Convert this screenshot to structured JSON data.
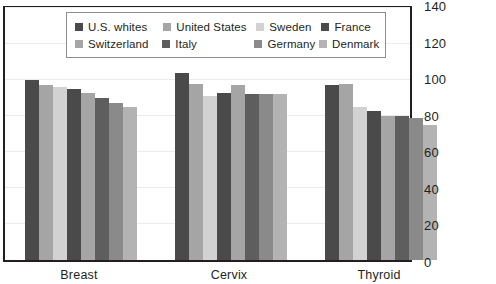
{
  "chart_data": {
    "type": "bar",
    "title": "",
    "subtitle": "",
    "xlabel": "",
    "ylabel": "",
    "categories": [
      "Breast",
      "Cervix",
      "Thyroid"
    ],
    "ylim": [
      0,
      140
    ],
    "yticks": [
      0,
      20,
      40,
      60,
      80,
      100,
      120,
      140
    ],
    "ytick_labels": [
      "0",
      "20",
      "40",
      "60",
      "80",
      "100",
      "120",
      "140"
    ],
    "grid": true,
    "legend_position": "top-center",
    "series": [
      {
        "name": "U.S. whites",
        "color": "#4a4a4a",
        "values": [
          100,
          104,
          97
        ]
      },
      {
        "name": "United States",
        "color": "#a5a5a5",
        "values": [
          97,
          98,
          98
        ]
      },
      {
        "name": "Sweden",
        "color": "#d2d2d2",
        "values": [
          96,
          91,
          85
        ]
      },
      {
        "name": "France",
        "color": "#4a4a4a",
        "values": [
          95,
          93,
          83
        ]
      },
      {
        "name": "Switzerland",
        "color": "#a5a5a5",
        "values": [
          93,
          97,
          80
        ]
      },
      {
        "name": "Italy",
        "color": "#5e5e5e",
        "values": [
          90,
          92,
          80
        ]
      },
      {
        "name": "Germany",
        "color": "#8a8a8a",
        "values": [
          87,
          92,
          79
        ]
      },
      {
        "name": "Denmark",
        "color": "#b3b3b3",
        "values": [
          85,
          92,
          75
        ]
      }
    ]
  },
  "legend": {
    "rows": [
      [
        {
          "label": "U.S. whites",
          "series_index": 0
        },
        {
          "label": "United States",
          "series_index": 1
        },
        {
          "label": "Sweden",
          "series_index": 2
        },
        {
          "label": "France",
          "series_index": 3
        }
      ],
      [
        {
          "label": "Switzerland",
          "series_index": 4
        },
        {
          "label": "Italy",
          "series_index": 5
        },
        {
          "label": "Germany",
          "series_index": 6
        },
        {
          "label": "Denmark",
          "series_index": 7
        }
      ]
    ]
  },
  "colors": {
    "axis": "#231f20",
    "grid": "#ececec",
    "legend_border": "#8d8d8d",
    "background": "#ffffff"
  }
}
